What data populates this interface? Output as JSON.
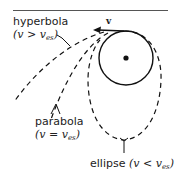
{
  "diagram": {
    "type": "orbit-trajectories",
    "velocity_label": "v",
    "labels": {
      "hyperbola": {
        "name": "hyperbola",
        "condition_open": "(",
        "condition_var": "v",
        "condition_op": " > ",
        "condition_rhs": "v",
        "condition_sub": "es",
        "condition_close": ")"
      },
      "parabola": {
        "name": "parabola",
        "condition_open": "(",
        "condition_var": "v",
        "condition_op": " = ",
        "condition_rhs": "v",
        "condition_sub": "es",
        "condition_close": ")"
      },
      "ellipse": {
        "name": "ellipse",
        "condition_open": " (",
        "condition_var": "v",
        "condition_op": " < ",
        "condition_rhs": "v",
        "condition_sub": "es",
        "condition_close": ")"
      }
    },
    "colors": {
      "stroke": "#111111",
      "text": "#222222",
      "background": "#ffffff"
    }
  }
}
